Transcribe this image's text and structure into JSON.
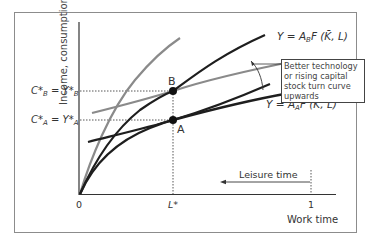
{
  "diagram": {
    "type": "production function diagram",
    "y_axis_label": "Income, consumption",
    "x_axis_label": "Work time",
    "leisure_label": "Leisure time",
    "origin_label": "0",
    "x_ticks": [
      {
        "label": "L*",
        "position": "L*"
      },
      {
        "label": "1",
        "position": "1"
      }
    ],
    "y_levels": [
      {
        "id": "B",
        "label_main": "C*",
        "label_sub_left": "B",
        "label_eq": " = Y*",
        "label_sub_right": "B"
      },
      {
        "id": "A",
        "label_main": "C*",
        "label_sub_left": "A",
        "label_eq": " = Y*",
        "label_sub_right": "A"
      }
    ],
    "points": [
      {
        "label": "B",
        "x": "L*",
        "y": "C*B = Y*B"
      },
      {
        "label": "A",
        "x": "L*",
        "y": "C*A = Y*A"
      }
    ],
    "curves": [
      {
        "name": "Y = A_B F(K̄, L)",
        "label_prefix": "Y = A",
        "label_sub": "B",
        "label_suffix": "F (K̄, L)",
        "color": "#1e1e1e",
        "kind": "production function (higher technology)"
      },
      {
        "name": "Y = A_A F(K̄, L)",
        "label_prefix": "Y = A",
        "label_sub": "A",
        "label_suffix": "F (K̄, L)",
        "color": "#1e1e1e",
        "kind": "production function (baseline)"
      },
      {
        "name": "indifference curve B",
        "color": "#8a8a8a",
        "kind": "indifference curve tangent at B"
      },
      {
        "name": "indifference curve A",
        "color": "#1e1e1e",
        "kind": "indifference curve tangent at A"
      }
    ],
    "annotation": "Better technology or rising capital stock turn curve upwards",
    "colors": {
      "frame": "#8c8c8c",
      "dark_curve": "#1e1e1e",
      "grey_curve": "#8a8a8a",
      "axis": "#333333"
    }
  }
}
